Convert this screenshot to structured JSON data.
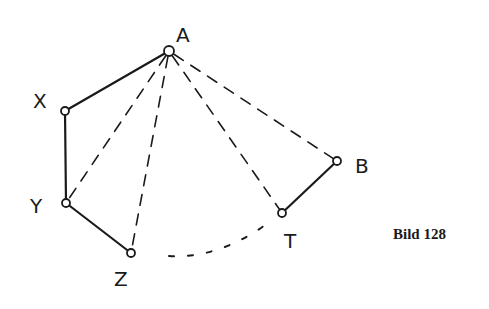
{
  "figure": {
    "caption": "Bild 128",
    "ink_color": "#1a1a1a",
    "points": [
      {
        "id": "A",
        "label": "A"
      },
      {
        "id": "X",
        "label": "X"
      },
      {
        "id": "Y",
        "label": "Y"
      },
      {
        "id": "Z",
        "label": "Z"
      },
      {
        "id": "T",
        "label": "T"
      },
      {
        "id": "B",
        "label": "B"
      }
    ],
    "solid_segments": [
      [
        "A",
        "X"
      ],
      [
        "X",
        "Y"
      ],
      [
        "Y",
        "Z"
      ],
      [
        "T",
        "B"
      ]
    ],
    "dashed_segments": [
      [
        "A",
        "Y"
      ],
      [
        "A",
        "Z"
      ],
      [
        "A",
        "T"
      ],
      [
        "A",
        "B"
      ]
    ],
    "dotted_arcs": [
      [
        "Z",
        "T"
      ]
    ]
  }
}
